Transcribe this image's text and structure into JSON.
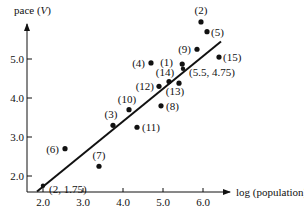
{
  "chart_data": {
    "type": "scatter",
    "title": "",
    "xlabel": "log (population)",
    "ylabel": "pace (V)",
    "ylabel_main": "pace (",
    "ylabel_var": "V",
    "ylabel_end": ")",
    "xlim": [
      1.8,
      6.6
    ],
    "ylim": [
      1.6,
      5.9
    ],
    "x_ticks": [
      2.0,
      3.0,
      4.0,
      5.0,
      6.0
    ],
    "x_tick_labels": [
      "2.0",
      "3.0",
      "4.0",
      "5.0",
      "6.0"
    ],
    "y_ticks": [
      2.0,
      3.0,
      4.0,
      5.0
    ],
    "y_tick_labels": [
      "2.0",
      "3.0",
      "4.0",
      "5.0"
    ],
    "grid": false,
    "points": [
      {
        "label": "(1)",
        "x": 5.48,
        "y": 4.87
      },
      {
        "label": "(2)",
        "x": 5.95,
        "y": 5.95
      },
      {
        "label": "(3)",
        "x": 3.75,
        "y": 3.3
      },
      {
        "label": "(4)",
        "x": 4.7,
        "y": 4.9
      },
      {
        "label": "(5)",
        "x": 6.1,
        "y": 5.7
      },
      {
        "label": "(6)",
        "x": 2.55,
        "y": 2.7
      },
      {
        "label": "(7)",
        "x": 3.4,
        "y": 2.25
      },
      {
        "label": "(8)",
        "x": 4.95,
        "y": 3.8
      },
      {
        "label": "(9)",
        "x": 5.85,
        "y": 5.25
      },
      {
        "label": "(10)",
        "x": 4.15,
        "y": 3.7
      },
      {
        "label": "(11)",
        "x": 4.35,
        "y": 3.25
      },
      {
        "label": "(12)",
        "x": 4.9,
        "y": 4.3
      },
      {
        "label": "(13)",
        "x": 5.4,
        "y": 4.38
      },
      {
        "label": "(14)",
        "x": 5.15,
        "y": 4.42
      },
      {
        "label": "(15)",
        "x": 6.4,
        "y": 5.05
      }
    ],
    "fit_line": {
      "x": [
        1.85,
        6.45
      ],
      "y": [
        1.6,
        5.45
      ]
    },
    "annotations": [
      {
        "text": "(2, 1.75)",
        "x": 2.0,
        "y": 1.75
      },
      {
        "text": "(5.5, 4.75)",
        "x": 5.5,
        "y": 4.75
      }
    ]
  }
}
